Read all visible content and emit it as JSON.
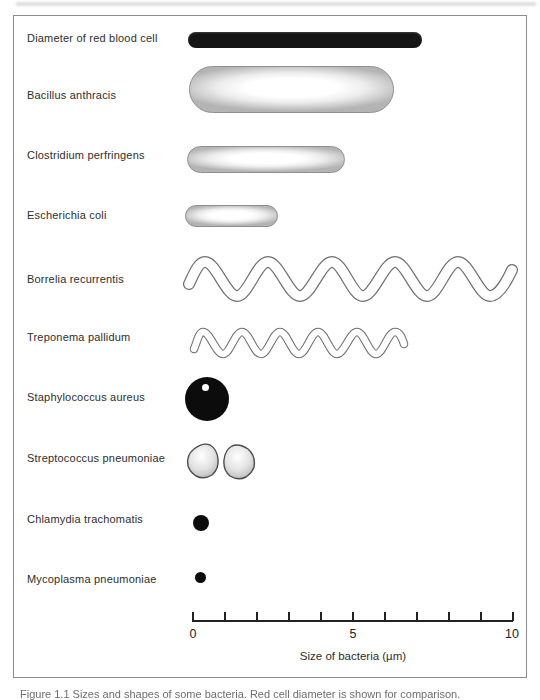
{
  "figure": {
    "caption": "Figure 1.1 Sizes and shapes of some bacteria. Red cell diameter is shown for comparison."
  },
  "organisms": [
    {
      "name": "Diameter of red blood cell",
      "shape": "solid-rod",
      "approx_length_um": 7.3
    },
    {
      "name": "Bacillus anthracis",
      "shape": "capsule-rod",
      "approx_length_um": 6.4
    },
    {
      "name": "Clostridium perfringens",
      "shape": "capsule-rod",
      "approx_length_um": 4.9
    },
    {
      "name": "Escherichia coli",
      "shape": "capsule-rod",
      "approx_length_um": 2.9
    },
    {
      "name": "Borrelia recurrentis",
      "shape": "spiral",
      "approx_length_um": 10.1
    },
    {
      "name": "Treponema pallidum",
      "shape": "spiral",
      "approx_length_um": 6.6
    },
    {
      "name": "Staphylococcus aureus",
      "shape": "coccus",
      "approx_length_um": 1.4
    },
    {
      "name": "Streptococcus pneumoniae",
      "shape": "diplococcus",
      "approx_length_um": 2.1
    },
    {
      "name": "Chlamydia trachomatis",
      "shape": "small-coccus",
      "approx_length_um": 0.5
    },
    {
      "name": "Mycoplasma pneumoniae",
      "shape": "small-coccus",
      "approx_length_um": 0.3
    }
  ],
  "axis": {
    "min": 0,
    "max": 10,
    "tick_step_um": 1,
    "tick_labels": [
      "0",
      "5",
      "10"
    ],
    "label": "Size of bacteria (µm)"
  },
  "colors": {
    "ink": "#222222",
    "solid_shape": "#0c0c0c",
    "outline_gray": "#6e6e6e",
    "capsule_edge": "#b4b4b4",
    "background": "#ffffff"
  }
}
